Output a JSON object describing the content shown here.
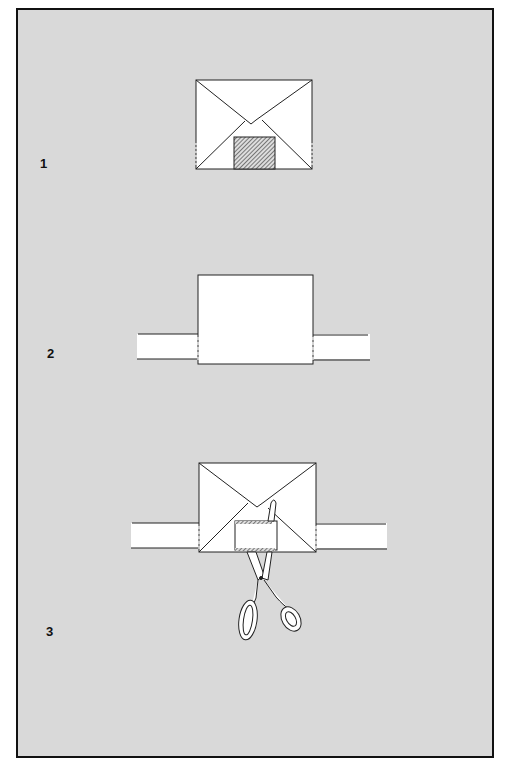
{
  "diagram": {
    "title": "",
    "steps": [
      {
        "number": "1",
        "description": "Envelope with stamp"
      },
      {
        "number": "2",
        "description": "Envelope placed over strip"
      },
      {
        "number": "3",
        "description": "Cutting around stamp with scissors"
      }
    ]
  },
  "colors": {
    "background": "#d9d9d9",
    "frame": "#111111",
    "paper": "#ffffff",
    "ink": "#222222"
  },
  "icons": {
    "stamp": "hatched-rectangle",
    "scissors": "scissors-icon"
  }
}
